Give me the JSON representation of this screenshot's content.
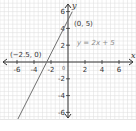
{
  "chart_data": {
    "type": "line",
    "title": "",
    "xlabel": "x",
    "ylabel": "y",
    "xlim": [
      -8,
      8
    ],
    "ylim": [
      -7,
      7
    ],
    "grid": true,
    "x_ticks": [
      -6,
      -4,
      -2,
      2,
      4,
      6
    ],
    "y_ticks": [
      6,
      4,
      2,
      -2,
      -4,
      -6
    ],
    "x_tick_labels": [
      "-6",
      "-4",
      "-2",
      "2",
      "4",
      "6"
    ],
    "y_tick_labels": [
      "6",
      "4",
      "2",
      "-2",
      "-4",
      "-6"
    ],
    "origin_label": "0",
    "series": [
      {
        "name": "y = 2x + 5",
        "equation": "y = 2x + 5",
        "slope": 2,
        "intercept": 5,
        "x": [
          -6,
          0.5
        ],
        "y": [
          -7,
          6
        ]
      }
    ],
    "annotations": [
      {
        "text": "(0, 5)",
        "x": 0,
        "y": 5
      },
      {
        "text": "(−2.5, 0)",
        "x": -2.5,
        "y": 0
      },
      {
        "text": "y = 2x + 5",
        "x": 4,
        "y": 2.5
      }
    ],
    "colors": {
      "grid": "#dcdcdc",
      "axis": "#333333",
      "line": "#6f6f6f",
      "equation_text": "#8a8a8a",
      "text": "#333333"
    }
  }
}
